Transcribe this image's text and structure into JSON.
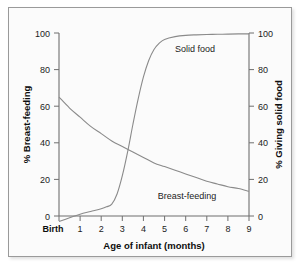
{
  "chart_data": {
    "type": "line",
    "title": "",
    "subtitle": "",
    "xlabel": "Age of infant (months)",
    "ylabel": "% Breast-feeding",
    "y2label": "% Giving solid food",
    "xlim": [
      0,
      9
    ],
    "ylim": [
      0,
      100
    ],
    "y2lim": [
      0,
      100
    ],
    "grid": false,
    "legend_position": "inline-annotations",
    "x_tick_labels": [
      "Birth",
      "1",
      "2",
      "3",
      "4",
      "5",
      "6",
      "7",
      "8",
      "9"
    ],
    "x_ticks": [
      0,
      1,
      2,
      3,
      4,
      5,
      6,
      7,
      8,
      9
    ],
    "y_ticks": [
      0,
      20,
      40,
      60,
      80,
      100
    ],
    "y_tick_labels": [
      "0",
      "20",
      "40",
      "60",
      "80",
      "100"
    ],
    "y2_ticks": [
      0,
      20,
      40,
      60,
      80,
      100
    ],
    "y2_tick_labels": [
      "0",
      "20",
      "40",
      "60",
      "80",
      "100"
    ],
    "series": [
      {
        "name": "Breast-feeding",
        "axis": "left",
        "color": "#8a8a8a",
        "annotation": "Breast-feeding",
        "annotation_x": 6.05,
        "annotation_y": 11,
        "x": [
          0,
          0.5,
          1,
          1.5,
          2,
          2.5,
          3,
          3.5,
          4,
          4.5,
          5,
          5.5,
          6,
          6.5,
          7,
          7.5,
          8,
          8.5,
          9
        ],
        "values": [
          65,
          59,
          54,
          49,
          45,
          41,
          38,
          35,
          32,
          29,
          27,
          25,
          23,
          21,
          19,
          17.5,
          16,
          15,
          13.5
        ]
      },
      {
        "name": "Solid food",
        "axis": "right",
        "color": "#8a8a8a",
        "annotation": "Solid food",
        "annotation_x": 6.3,
        "annotation_y": 90,
        "x": [
          0,
          0.5,
          1,
          1.5,
          2,
          2.25,
          2.5,
          2.75,
          3,
          3.25,
          3.5,
          3.75,
          4,
          4.25,
          4.5,
          4.75,
          5,
          5.5,
          6,
          6.5,
          7,
          7.5,
          8,
          8.5,
          9
        ],
        "values": [
          -3,
          -1,
          1,
          2.5,
          4,
          5,
          6.5,
          12,
          22,
          35,
          50,
          64,
          76,
          85,
          91,
          94.5,
          96.5,
          98,
          98.7,
          99,
          99.2,
          99.3,
          99.4,
          99.5,
          99.5
        ]
      }
    ],
    "crossover": {
      "x": 3.3,
      "y": 36
    }
  },
  "figure": {
    "background_color": "#fbfbfb",
    "border_color": "#9a9a9a",
    "curve_color": "#8a8a8a",
    "axis_color": "#6f6f6f",
    "text_color": "#1c1c1c"
  }
}
